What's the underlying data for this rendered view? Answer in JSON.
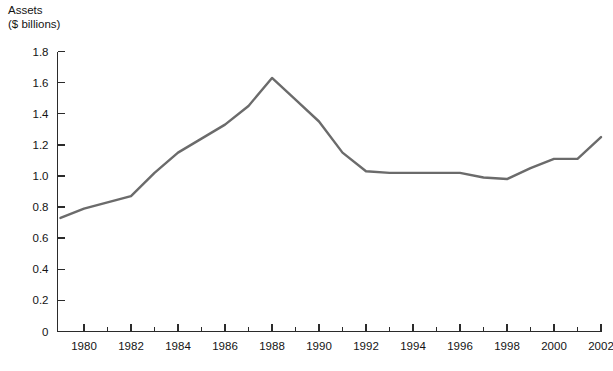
{
  "chart_data": {
    "type": "line",
    "title": "",
    "subtitle": "",
    "xlabel": "",
    "ylabel": "Assets",
    "ylabel_units": "($ billions)",
    "ylabel_line1": "Assets",
    "ylabel_line2": "($ billions)",
    "grid": false,
    "legend": false,
    "legend_position": "none",
    "xlim": [
      1978.85,
      2002.2
    ],
    "ylim": [
      0,
      1.8
    ],
    "ytick_labels": [
      "1.8",
      "1.6",
      "1.4",
      "1.2",
      "1.0",
      "0.8",
      "0.6",
      "0.4",
      "0.2",
      "0"
    ],
    "ytick_values": [
      1.8,
      1.6,
      1.4,
      1.2,
      1.0,
      0.8,
      0.6,
      0.4,
      0.2,
      0
    ],
    "xtick_labels": [
      "1980",
      "1982",
      "1984",
      "1986",
      "1988",
      "1990",
      "1992",
      "1994",
      "1996",
      "1998",
      "2000",
      "2002"
    ],
    "xtick_values": [
      1980,
      1982,
      1984,
      1986,
      1988,
      1990,
      1992,
      1994,
      1996,
      1998,
      2000,
      2002
    ],
    "xtick_minor_values": [
      1981,
      1983,
      1985,
      1987,
      1989,
      1991,
      1993,
      1995,
      1997,
      1999,
      2001
    ],
    "line_color": "#6b6b6b",
    "axis_color": "#2b2b2b",
    "x": [
      1979,
      1980,
      1981,
      1982,
      1983,
      1984,
      1985,
      1986,
      1987,
      1988,
      1989,
      1990,
      1991,
      1992,
      1993,
      1994,
      1995,
      1996,
      1997,
      1998,
      1999,
      2000,
      2001,
      2002
    ],
    "values": [
      0.73,
      0.79,
      0.83,
      0.87,
      1.02,
      1.15,
      1.24,
      1.33,
      1.45,
      1.63,
      1.49,
      1.35,
      1.15,
      1.03,
      1.02,
      1.02,
      1.02,
      1.02,
      0.99,
      0.98,
      1.05,
      1.11,
      1.11,
      1.25
    ],
    "series": [
      {
        "name": "Assets",
        "values": [
          0.73,
          0.79,
          0.83,
          0.87,
          1.02,
          1.15,
          1.24,
          1.33,
          1.45,
          1.63,
          1.49,
          1.35,
          1.15,
          1.03,
          1.02,
          1.02,
          1.02,
          1.02,
          0.99,
          0.98,
          1.05,
          1.11,
          1.11,
          1.25
        ]
      }
    ],
    "annotations": []
  }
}
